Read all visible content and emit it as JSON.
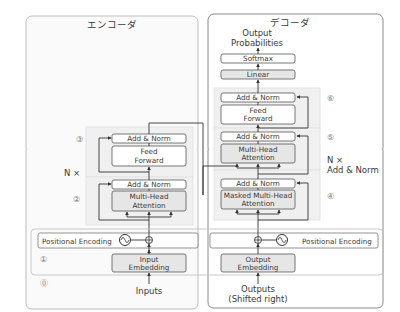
{
  "encoder": {
    "title": "エンコーダ",
    "add_norm_1": "Add & Norm",
    "feed_forward_1": "Feed",
    "feed_forward_2": "Forward",
    "add_norm_2": "Add & Norm",
    "mha_1": "Multi-Head",
    "mha_2": "Attention",
    "n_times": "N ×",
    "pos_enc": "Positional Encoding",
    "embed_1": "Input",
    "embed_2": "Embedding",
    "inputs": "Inputs",
    "marks": {
      "m0": "⓪",
      "m1": "①",
      "m2": "②",
      "m3": "③"
    }
  },
  "decoder": {
    "title": "デコーダ",
    "out_prob_1": "Output",
    "out_prob_2": "Probabilities",
    "softmax": "Softmax",
    "linear": "Linear",
    "add_norm_top": "Add & Norm",
    "ff_1": "Feed",
    "ff_2": "Forward",
    "add_norm_mid": "Add & Norm",
    "mha_1": "Multi-Head",
    "mha_2": "Attention",
    "add_norm_bot": "Add & Norm",
    "mmha_1": "Masked Multi-Head",
    "mmha_2": "Attention",
    "n_times": "N ×",
    "n_times_sub": "Add & Norm",
    "pos_enc": "Positional Encoding",
    "embed_1": "Output",
    "embed_2": "Embedding",
    "outputs_1": "Outputs",
    "outputs_2": "(Shifted right)",
    "marks": {
      "m4": "④",
      "m5": "⑤",
      "m6": "⑥"
    }
  },
  "colors": {
    "stroke": "#555555",
    "box_fill": "#ffffff",
    "grey_fill": "#e6e6e6",
    "group_fill": "#f3f3f3",
    "panel_stroke": "#8a8a8a"
  }
}
